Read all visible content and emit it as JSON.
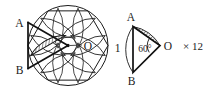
{
  "figure": {
    "type": "geometry-diagram",
    "left_diagram": {
      "name": "flower-circle",
      "labels": {
        "a": "A",
        "b": "B",
        "o": "O"
      },
      "center": {
        "x": 68,
        "y": 45.5
      },
      "radius": 40,
      "petal_count": 6,
      "shaded_region": "segment-AOB"
    },
    "right_diagram": {
      "name": "detail-triangle",
      "labels": {
        "a": "A",
        "b": "B",
        "o": "O",
        "angle": "60°",
        "side": "1"
      },
      "apex": {
        "x": 160,
        "y": 45
      },
      "angle_degrees": 60,
      "side_length": "1",
      "shaded_region": "segment-AO"
    },
    "multiplier": {
      "times_symbol": "×",
      "count": "12",
      "text": "× 12"
    },
    "colors": {
      "ink": "#1a1a1a",
      "background": "#ffffff",
      "hatch": "#333333"
    }
  }
}
